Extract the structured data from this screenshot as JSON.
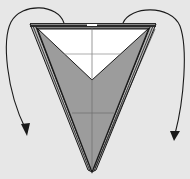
{
  "diagram": {
    "type": "origami-fold-step",
    "colors": {
      "background": "#e7e7e7",
      "paper_color_side": "#9c9c9c",
      "paper_white_side": "#ffffff",
      "outline": "#1a1a1a",
      "crease": "#6e6e6e",
      "arrow": "#1a1a1a"
    },
    "elements": [
      {
        "name": "outer-triangle",
        "fill": "gray"
      },
      {
        "name": "inner-white-triangle",
        "fill": "white"
      },
      {
        "name": "vertical-center-crease"
      },
      {
        "name": "horizontal-crease-upper"
      },
      {
        "name": "horizontal-crease-lower"
      },
      {
        "name": "left-fold-arrow",
        "direction": "down-left"
      },
      {
        "name": "right-fold-arrow",
        "direction": "down-right"
      }
    ]
  }
}
